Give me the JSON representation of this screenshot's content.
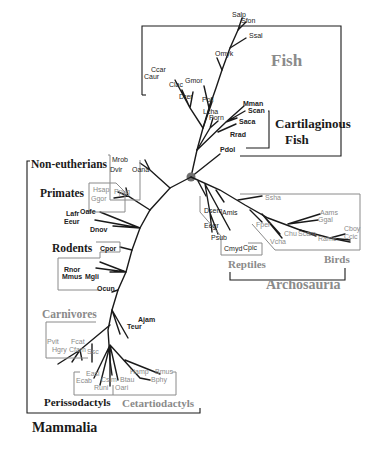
{
  "groups": {
    "fish": "Fish",
    "cartilaginous_1": "Cartilaginous",
    "cartilaginous_2": "Fish",
    "non_eutherians": "Non-eutherians",
    "primates": "Primates",
    "rodents": "Rodents",
    "carnivores": "Carnivores",
    "perissodactyls": "Perissodactyls",
    "cetartiodactyls": "Cetartiodactyls",
    "mammalia": "Mammalia",
    "reptiles": "Reptiles",
    "birds": "Birds",
    "archosauria": "Archosauria"
  },
  "taxa": {
    "fish": [
      "Salp",
      "Sfon",
      "Ssal",
      "Omyk",
      "Gmor",
      "Ccar",
      "Caur",
      "Clac",
      "Drer",
      "Poli",
      "Lcha",
      "Porn"
    ],
    "cartilaginous": [
      "Mman",
      "Scan",
      "Saca",
      "Rrad",
      "Pdol"
    ],
    "non_eutherians": [
      "Mrob",
      "Dvir",
      "Oana"
    ],
    "primates": [
      "Hsap",
      "Ppyg",
      "Ggor"
    ],
    "afrotheria": [
      "Lafr",
      "Oafe",
      "Eeur",
      "Dnov"
    ],
    "rodents": [
      "Cpor",
      "Rnor",
      "Mmus",
      "Mgli",
      "Ocun"
    ],
    "laurasiatheria_misc": [
      "Ajam",
      "Teur"
    ],
    "carnivores": [
      "Pvit",
      "Fcat",
      "Hgry",
      "Cfam",
      "Ssc"
    ],
    "perissodactyls": [
      "Easi",
      "Ecab",
      "Runi"
    ],
    "cetartiodactyls": [
      "Csim",
      "Btau",
      "Oari",
      "Hamp",
      "Bmus",
      "Bphy"
    ],
    "reptiles": [
      "Dsem",
      "Amis",
      "Eegr",
      "Psub",
      "Cmyd",
      "Cpic"
    ],
    "birds": [
      "Ssha",
      "Fper",
      "Chu",
      "Vcha",
      "Scam",
      "Aams",
      "Ggal",
      "Rame",
      "Cboy",
      "Ccic"
    ]
  },
  "colors": {
    "dark": "#1a1a1a",
    "grey": "#8a8a8a",
    "root_node": "#707070"
  }
}
